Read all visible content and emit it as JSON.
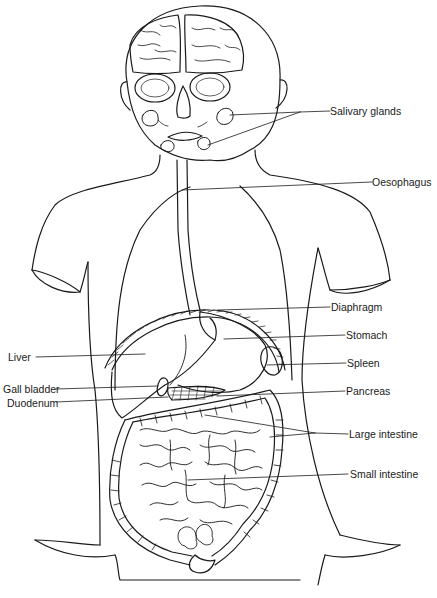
{
  "diagram": {
    "labels": {
      "salivary_glands": "Salivary glands",
      "oesophagus": "Oesophagus",
      "diaphragm": "Diaphragm",
      "stomach": "Stomach",
      "liver": "Liver",
      "spleen": "Spleen",
      "gall_bladder": "Gall bladder",
      "pancreas": "Pancreas",
      "duodenum": "Duodenum",
      "large_intestine": "Large intestine",
      "small_intestine": "Small intestine"
    },
    "colors": {
      "line": "#1a1a1a",
      "background": "#ffffff"
    }
  }
}
